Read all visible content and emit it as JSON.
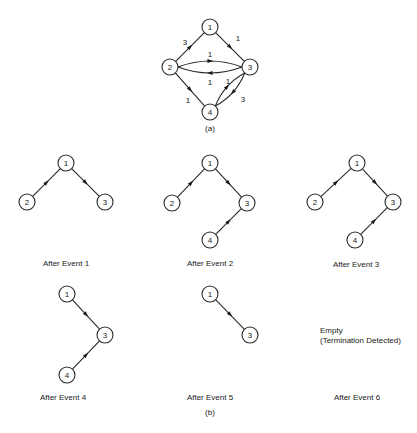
{
  "figure": {
    "part_a": {
      "label": "(a)",
      "nodes": [
        "1",
        "2",
        "3",
        "4"
      ],
      "edges": [
        {
          "from": "2",
          "to": "1",
          "weight": "3"
        },
        {
          "from": "1",
          "to": "3",
          "weight": "1"
        },
        {
          "from": "2",
          "to": "3",
          "weight": "1",
          "route": "upper"
        },
        {
          "from": "3",
          "to": "2",
          "weight": "1",
          "route": "lower"
        },
        {
          "from": "2",
          "to": "4",
          "weight": "1"
        },
        {
          "from": "4",
          "to": "3",
          "weight": "1",
          "route": "inner"
        },
        {
          "from": "3",
          "to": "4",
          "weight": "3",
          "route": "outer"
        }
      ]
    },
    "part_b": {
      "label": "(b)",
      "panels": [
        {
          "caption": "After Event 1",
          "nodes": [
            "1",
            "2",
            "3"
          ],
          "edges": [
            [
              "2",
              "1"
            ],
            [
              "1",
              "3"
            ]
          ]
        },
        {
          "caption": "After Event 2",
          "nodes": [
            "1",
            "2",
            "3",
            "4"
          ],
          "edges": [
            [
              "2",
              "1"
            ],
            [
              "1",
              "3"
            ],
            [
              "4",
              "3"
            ]
          ]
        },
        {
          "caption": "After Event 3",
          "nodes": [
            "1",
            "2",
            "3",
            "4"
          ],
          "edges": [
            [
              "2",
              "1"
            ],
            [
              "1",
              "3"
            ],
            [
              "4",
              "3"
            ]
          ]
        },
        {
          "caption": "After Event 4",
          "nodes": [
            "1",
            "3",
            "4"
          ],
          "edges": [
            [
              "1",
              "3"
            ],
            [
              "4",
              "3"
            ]
          ]
        },
        {
          "caption": "After Event 5",
          "nodes": [
            "1",
            "3"
          ],
          "edges": [
            [
              "1",
              "3"
            ]
          ]
        },
        {
          "caption": "After Event 6",
          "nodes": [],
          "edges": [],
          "note_line1": "Empty",
          "note_line2": "(Termination Detected)"
        }
      ]
    }
  }
}
